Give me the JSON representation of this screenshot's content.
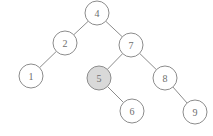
{
  "figure": {
    "type": "binary-search-tree-diagram",
    "background_color": "#ffffff",
    "stroke_color": "#8c8c8c",
    "label_color": "#6e6e6e",
    "node_fill_default": "#ffffff",
    "node_fill_highlight": "#d9d9d9",
    "node_radius": 12
  },
  "nodes": [
    {
      "id": "n4",
      "label": "4",
      "cx": 97,
      "cy": 13,
      "highlighted": false
    },
    {
      "id": "n2",
      "label": "2",
      "cx": 65,
      "cy": 43,
      "highlighted": false
    },
    {
      "id": "n7",
      "label": "7",
      "cx": 131,
      "cy": 45,
      "highlighted": false
    },
    {
      "id": "n1",
      "label": "1",
      "cx": 31,
      "cy": 76,
      "highlighted": false
    },
    {
      "id": "n5",
      "label": "5",
      "cx": 99,
      "cy": 78,
      "highlighted": true
    },
    {
      "id": "n8",
      "label": "8",
      "cx": 165,
      "cy": 78,
      "highlighted": false
    },
    {
      "id": "n6",
      "label": "6",
      "cx": 132,
      "cy": 111,
      "highlighted": false
    },
    {
      "id": "n9",
      "label": "9",
      "cx": 195,
      "cy": 112,
      "highlighted": false
    }
  ],
  "edges": [
    {
      "id": "e4-2",
      "from": "n4",
      "to": "n2",
      "side": "left"
    },
    {
      "id": "e4-7",
      "from": "n4",
      "to": "n7",
      "side": "right"
    },
    {
      "id": "e2-1",
      "from": "n2",
      "to": "n1",
      "side": "left"
    },
    {
      "id": "e7-5",
      "from": "n7",
      "to": "n5",
      "side": "left"
    },
    {
      "id": "e7-8",
      "from": "n7",
      "to": "n8",
      "side": "right"
    },
    {
      "id": "e5-6",
      "from": "n5",
      "to": "n6",
      "side": "right"
    },
    {
      "id": "e8-9",
      "from": "n8",
      "to": "n9",
      "side": "right"
    }
  ]
}
